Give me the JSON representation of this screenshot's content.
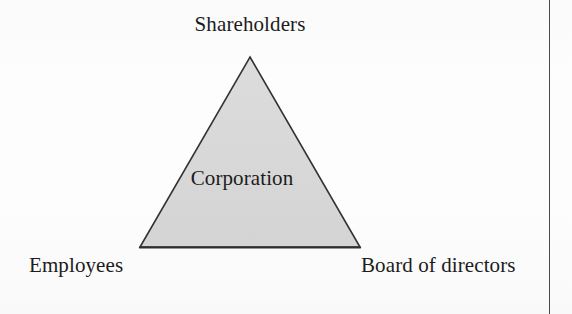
{
  "page": {
    "background_color": "#fdfdfd",
    "border_rule_color": "#4a4a4a"
  },
  "diagram": {
    "type": "triangle-stakeholder-diagram",
    "shape": {
      "name": "triangle",
      "fill_color": "#d8d8d8",
      "stroke_color": "#333333",
      "vertices": {
        "apex": {
          "x": 250,
          "y": 57
        },
        "bottom_left": {
          "x": 140,
          "y": 247
        },
        "bottom_right": {
          "x": 360,
          "y": 247
        }
      }
    },
    "center_label": "Corporation",
    "vertex_labels": [
      {
        "position": "top",
        "label": "Shareholders"
      },
      {
        "position": "bottom-left",
        "label": "Employees"
      },
      {
        "position": "bottom-right",
        "label": "Board of directors"
      }
    ]
  }
}
